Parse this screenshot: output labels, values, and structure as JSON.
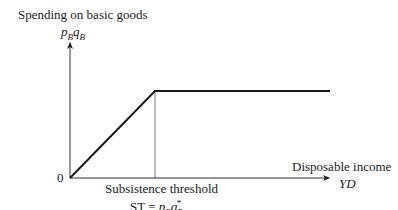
{
  "diagram": {
    "y_axis": {
      "title": "Spending on basic goods",
      "symbol_p": "p",
      "symbol_p_sub": "B",
      "symbol_q": "q",
      "symbol_q_sub": "B"
    },
    "x_axis": {
      "title": "Disposable income",
      "symbol": "YD"
    },
    "origin_label": "0",
    "threshold": {
      "title": "Subsistence threshold",
      "eq_prefix": "ST = ",
      "p": "p",
      "p_sub": "B",
      "q": "q",
      "q_sub": "B",
      "q_sup": "*"
    },
    "geometry": {
      "origin": [
        70,
        178
      ],
      "y_axis_top": [
        70,
        42
      ],
      "x_axis_end": [
        328,
        178
      ],
      "kink": [
        155,
        91
      ],
      "flat_end": [
        330,
        91
      ]
    },
    "colors": {
      "line": "#1a1a1a",
      "axis": "#333333"
    }
  }
}
